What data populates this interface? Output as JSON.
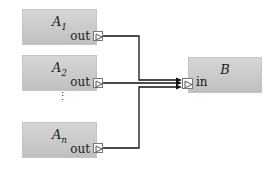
{
  "blocks": {
    "a1": {
      "name": "A",
      "sub": "1",
      "port": "out"
    },
    "a2": {
      "name": "A",
      "sub": "2",
      "port": "out"
    },
    "an": {
      "name": "A",
      "sub": "n",
      "port": "out"
    },
    "b": {
      "name": "B",
      "port": "in"
    }
  },
  "ellipsis": "⋮",
  "colors": {
    "block_fill": "#c9c9c9",
    "wire": "#111111",
    "port_border": "#777777"
  }
}
